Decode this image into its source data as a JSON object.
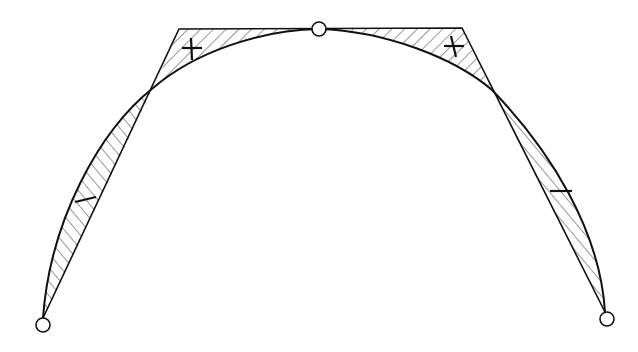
{
  "diagram": {
    "colors": {
      "stroke": "#111111",
      "hatch": "#333333",
      "background": "#ffffff",
      "node_fill": "#ffffff"
    },
    "nodes": [
      {
        "id": "start",
        "x": 43,
        "y": 325
      },
      {
        "id": "top",
        "x": 319,
        "y": 29
      },
      {
        "id": "end",
        "x": 607,
        "y": 319
      }
    ],
    "control_polygon": [
      [
        43,
        325
      ],
      [
        179,
        29
      ],
      [
        319,
        29
      ],
      [
        462,
        28
      ],
      [
        607,
        319
      ]
    ],
    "labels": {
      "top_left": "+",
      "top_right": "+",
      "left": "−",
      "right": "−"
    }
  }
}
